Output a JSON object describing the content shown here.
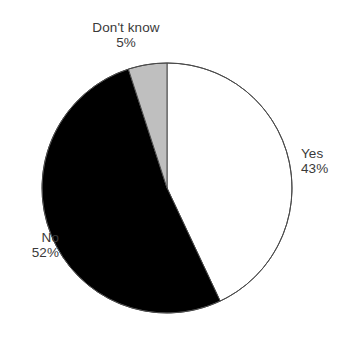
{
  "chart_data": {
    "type": "pie",
    "title": "",
    "subtitle": "",
    "xlabel": "",
    "ylabel": "",
    "legend_position": "none",
    "grid": false,
    "center": {
      "x": 167,
      "y": 188
    },
    "radius": 125,
    "start_angle_deg": 0,
    "direction": "clockwise",
    "categories": [
      "Yes",
      "No",
      "Don't know"
    ],
    "values": [
      43,
      52,
      5
    ],
    "value_labels": [
      "43%",
      "52%",
      "5%"
    ],
    "colors": [
      "#ffffff",
      "#000000",
      "#bfbfbf"
    ],
    "stroke_color": "#4a4a4a",
    "stroke_width": 1,
    "background": "#ffffff",
    "label_color": "#3a3a3a",
    "slices": [
      {
        "name": "Yes",
        "value": 43,
        "value_label": "43%",
        "color": "#ffffff",
        "start_deg": 0,
        "end_deg": 154.8,
        "label_position": "right"
      },
      {
        "name": "No",
        "value": 52,
        "value_label": "52%",
        "color": "#000000",
        "start_deg": 154.8,
        "end_deg": 342.0,
        "label_position": "left"
      },
      {
        "name": "Don't know",
        "value": 5,
        "value_label": "5%",
        "color": "#bfbfbf",
        "start_deg": 342.0,
        "end_deg": 360.0,
        "label_position": "top"
      }
    ]
  },
  "labels": {
    "dont_know": {
      "name": "Don't know",
      "value": "5%"
    },
    "yes": {
      "name": "Yes",
      "value": "43%"
    },
    "no": {
      "name": "No",
      "value": "52%"
    }
  }
}
